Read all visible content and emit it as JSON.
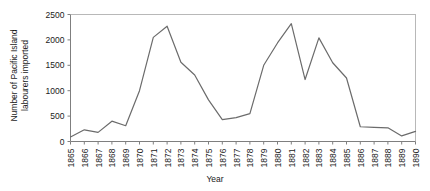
{
  "chart_data": {
    "type": "line",
    "title": "",
    "xlabel": "Year",
    "ylabel": "Number of Pacific Island labourers imported",
    "ylabel_line1": "Number of Pacific Island",
    "ylabel_line2": "labourers imported",
    "xlim": [
      1865,
      1890
    ],
    "ylim": [
      0,
      2500
    ],
    "ytick_labels": [
      "0",
      "500",
      "1000",
      "1500",
      "2000",
      "2500"
    ],
    "ytick_values": [
      0,
      500,
      1000,
      1500,
      2000,
      2500
    ],
    "grid": false,
    "legend": false,
    "categories": [
      "1865",
      "1866",
      "1867",
      "1868",
      "1869",
      "1870",
      "1871",
      "1872",
      "1873",
      "1874",
      "1875",
      "1876",
      "1877",
      "1878",
      "1879",
      "1880",
      "1881",
      "1882",
      "1883",
      "1884",
      "1885",
      "1886",
      "1887",
      "1888",
      "1889",
      "1890"
    ],
    "x": [
      1865,
      1866,
      1867,
      1868,
      1869,
      1870,
      1871,
      1872,
      1873,
      1874,
      1875,
      1876,
      1877,
      1878,
      1879,
      1880,
      1881,
      1882,
      1883,
      1884,
      1885,
      1886,
      1887,
      1888,
      1889,
      1890
    ],
    "values": [
      90,
      230,
      180,
      400,
      310,
      1000,
      2050,
      2270,
      1560,
      1310,
      820,
      430,
      470,
      550,
      1500,
      1940,
      2320,
      1220,
      2040,
      1550,
      1250,
      290,
      280,
      270,
      110,
      200
    ],
    "series": [
      {
        "name": "Pacific Island labourers imported",
        "color": "#6b6b6b",
        "values": [
          90,
          230,
          180,
          400,
          310,
          1000,
          2050,
          2270,
          1560,
          1310,
          820,
          430,
          470,
          550,
          1500,
          1940,
          2320,
          1220,
          2040,
          1550,
          1250,
          290,
          280,
          270,
          110,
          200
        ]
      }
    ]
  },
  "colors": {
    "line": "#6b6b6b",
    "axis": "#7f7f7f",
    "border": "#b8b8b8",
    "text": "#1a1a1a",
    "background": "#ffffff"
  }
}
